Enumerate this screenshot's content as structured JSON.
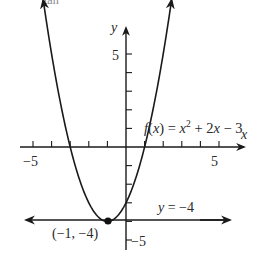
{
  "cropped_text": "tan",
  "chart_data": {
    "type": "line",
    "title": "",
    "function_label": "f(x) = x² + 2x − 3",
    "function": {
      "name": "f(x) = x^2 + 2x - 3",
      "a": 1,
      "b": 2,
      "c": -3
    },
    "series": [
      {
        "name": "f(x) = x² + 2x − 3",
        "x": [
          -4,
          -3,
          -2,
          -1,
          0,
          1,
          2
        ],
        "values": [
          5,
          0,
          -3,
          -4,
          -3,
          0,
          5
        ]
      },
      {
        "name": "y = −4",
        "type": "horizontal_line",
        "y": -4
      }
    ],
    "vertex": {
      "x": -1,
      "y": -4,
      "label": "(−1, −4)"
    },
    "asymptote_label": "y = −4",
    "xlabel": "x",
    "ylabel": "y",
    "x_tick_labels": [
      "−5",
      "5"
    ],
    "y_tick_labels": [
      "5",
      "−5"
    ],
    "xlim": [
      -6,
      6
    ],
    "ylim": [
      -6,
      6
    ],
    "grid": false,
    "legend": "none"
  }
}
